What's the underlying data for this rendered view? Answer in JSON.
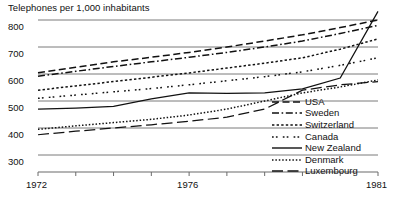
{
  "chart_data": {
    "type": "line",
    "title": "Telephones per 1,000 inhabitants",
    "xlabel": "",
    "ylabel": "",
    "xlim": [
      1972,
      1981
    ],
    "ylim": [
      280,
      830
    ],
    "grid": true,
    "legend_position": "inside-lower-right",
    "x": [
      1972,
      1973,
      1974,
      1975,
      1976,
      1977,
      1978,
      1979,
      1980,
      1981
    ],
    "y_ticks": [
      800,
      700,
      600,
      500,
      400,
      300
    ],
    "y_tick_labels": [
      "800",
      "700",
      "600",
      "500",
      "400",
      "300"
    ],
    "x_ticks": [
      1972,
      1973,
      1974,
      1975,
      1976,
      1977,
      1978,
      1979,
      1980,
      1981
    ],
    "x_tick_labels_shown": [
      {
        "value": 1972,
        "label": "1972"
      },
      {
        "value": 1976,
        "label": "1976"
      },
      {
        "value": 1981,
        "label": "1981"
      }
    ],
    "series": [
      {
        "name": "USA",
        "dash": "dashed",
        "values": [
          605,
          625,
          645,
          662,
          680,
          700,
          722,
          745,
          772,
          800
        ]
      },
      {
        "name": "Sweden",
        "dash": "dash-dot",
        "values": [
          592,
          610,
          628,
          645,
          662,
          680,
          700,
          722,
          750,
          780
        ]
      },
      {
        "name": "Switzerland",
        "dash": "dotted",
        "values": [
          540,
          556,
          572,
          588,
          604,
          622,
          640,
          660,
          692,
          730
        ]
      },
      {
        "name": "Canada",
        "dash": "dot-dot",
        "values": [
          510,
          522,
          534,
          546,
          560,
          575,
          590,
          608,
          632,
          660
        ]
      },
      {
        "name": "New Zealand",
        "dash": "solid",
        "values": [
          470,
          474,
          480,
          508,
          530,
          528,
          530,
          545,
          585,
          832
        ]
      },
      {
        "name": "Denmark",
        "dash": "fine-dotted",
        "values": [
          395,
          408,
          420,
          432,
          448,
          470,
          500,
          530,
          552,
          578
        ]
      },
      {
        "name": "Luxembourg",
        "dash": "long-dash",
        "values": [
          375,
          388,
          400,
          412,
          425,
          440,
          470,
          540,
          560,
          572
        ]
      }
    ]
  },
  "legend": {
    "items": [
      {
        "label": "USA",
        "dash": "dashed"
      },
      {
        "label": "Sweden",
        "dash": "dash-dot"
      },
      {
        "label": "Switzerland",
        "dash": "dotted"
      },
      {
        "label": "Canada",
        "dash": "dot-dot"
      },
      {
        "label": "New Zealand",
        "dash": "solid"
      },
      {
        "label": "Denmark",
        "dash": "fine-dotted"
      },
      {
        "label": "Luxembourg",
        "dash": "long-dash"
      }
    ]
  },
  "colors": {
    "ink": "#111111",
    "grid": "#6b6b6b",
    "background": "#ffffff"
  }
}
